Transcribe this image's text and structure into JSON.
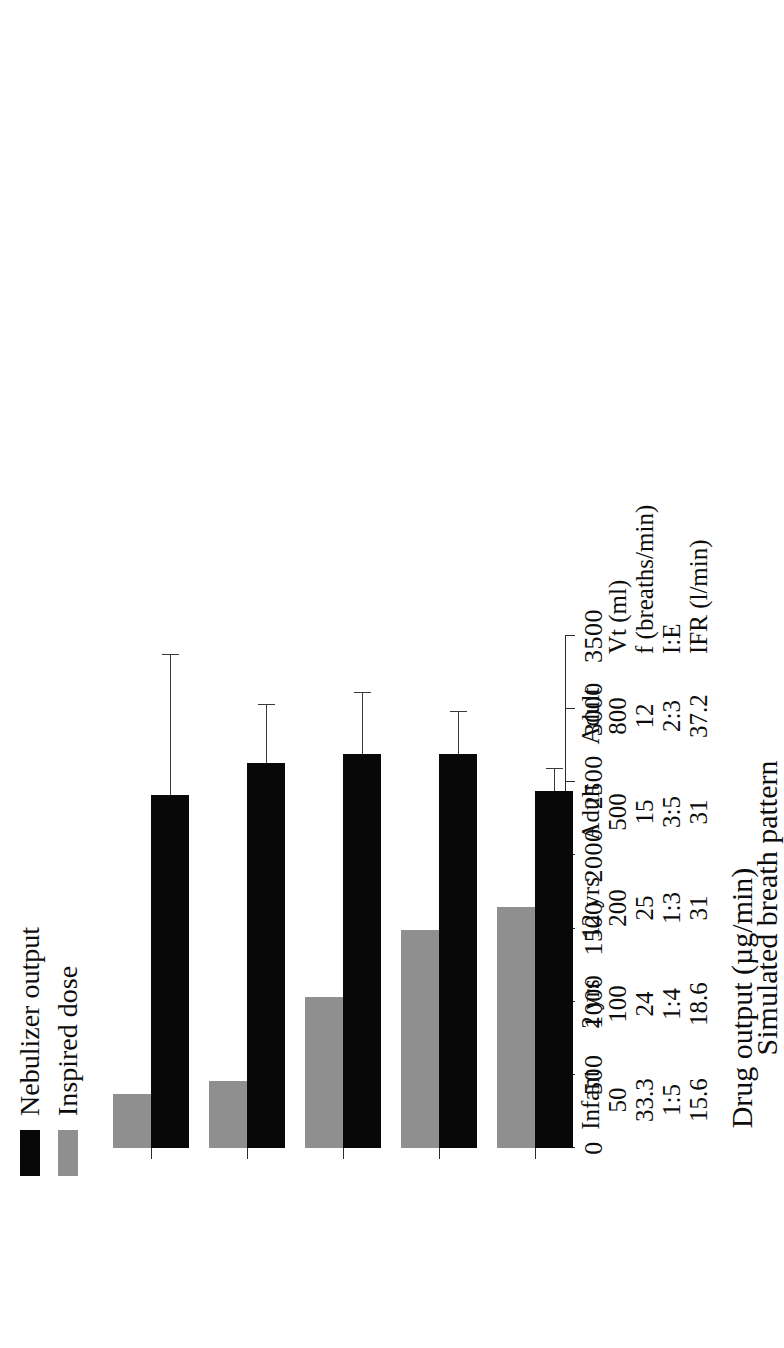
{
  "figure": {
    "orientation": "rotated-90"
  },
  "legend": {
    "position": "top-left",
    "items": [
      {
        "label": "Nebulizer output",
        "color": "#080808",
        "key": "nebulizer-output"
      },
      {
        "label": "Inspired dose",
        "color": "#8f8f8f",
        "key": "inspired-dose"
      }
    ]
  },
  "axes": {
    "value_axis_title": "Drug output (µg/min)",
    "category_axis_title": "Simulated breath pattern",
    "tick_labels": [
      "0",
      "500",
      "1000",
      "1500",
      "2000",
      "2500",
      "3000",
      "3500"
    ]
  },
  "parameter_rows": {
    "lines": [
      "",
      "Vt (ml)",
      "f (breaths/min)",
      "I:E",
      "IFR (l/min)"
    ]
  },
  "categories": [
    {
      "name": "Infant",
      "lines": [
        "Infant",
        "50",
        "33.3",
        "1:5",
        "15.6"
      ],
      "vt": "50",
      "f": "33.3",
      "ie": "1:5",
      "ifr": "15.6"
    },
    {
      "name": "2 yrs",
      "lines": [
        "2 yrs",
        "100",
        "24",
        "1:4",
        "18.6"
      ],
      "vt": "100",
      "f": "24",
      "ie": "1:4",
      "ifr": "18.6"
    },
    {
      "name": "12 yrs",
      "lines": [
        "12 yrs",
        "200",
        "25",
        "1:3",
        "31"
      ],
      "vt": "200",
      "f": "25",
      "ie": "1:3",
      "ifr": "31"
    },
    {
      "name": "Adult 500",
      "lines": [
        "Adult",
        "500",
        "15",
        "3:5",
        "31"
      ],
      "vt": "500",
      "f": "15",
      "ie": "3:5",
      "ifr": "31"
    },
    {
      "name": "Adult 800",
      "lines": [
        "Adult",
        "800",
        "12",
        "2:3",
        "37.2"
      ],
      "vt": "800",
      "f": "12",
      "ie": "2:3",
      "ifr": "37.2"
    }
  ],
  "chart_data": {
    "type": "bar",
    "title": "",
    "orientation": "horizontal",
    "categories": [
      "Infant",
      "2 yrs",
      "12 yrs",
      "Adult 500",
      "Adult 800"
    ],
    "series": [
      {
        "name": "Nebulizer output",
        "color": "#080808",
        "values": [
          2410,
          2630,
          2690,
          2690,
          2440
        ],
        "errors": [
          960,
          400,
          420,
          290,
          150
        ]
      },
      {
        "name": "Inspired dose",
        "color": "#8f8f8f",
        "values": [
          370,
          460,
          1030,
          1490,
          1650
        ],
        "errors": [
          0,
          0,
          0,
          0,
          0
        ]
      }
    ],
    "xlabel": "Simulated breath pattern",
    "ylabel": "Drug output (µg/min)",
    "ylim": [
      0,
      3500
    ],
    "ytick_step": 500,
    "grid": false,
    "legend_position": "top-left"
  }
}
